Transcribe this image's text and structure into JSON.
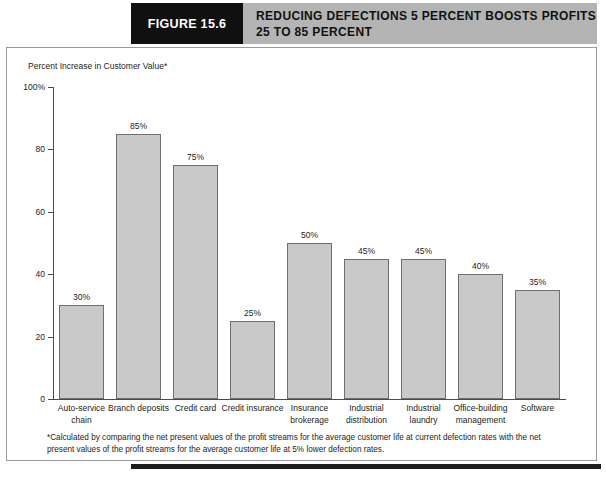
{
  "figure": {
    "number_label": "FIGURE 15.6",
    "title_line1": "REDUCING DEFECTIONS 5 PERCENT BOOSTS PROFITS",
    "title_line2": "25 TO 85 PERCENT"
  },
  "chart_data": {
    "type": "bar",
    "title": "REDUCING DEFECTIONS 5 PERCENT BOOSTS PROFITS 25 TO 85 PERCENT",
    "ylabel": "Percent Increase in Customer Value*",
    "xlabel": "",
    "ylim": [
      0,
      100
    ],
    "yticks": [
      0,
      20,
      40,
      60,
      80,
      100
    ],
    "ytick_labels": [
      "0",
      "20",
      "40",
      "60",
      "80",
      "100%"
    ],
    "grid": false,
    "legend": "none",
    "bar_color": "#c9c9c9",
    "bar_border_color": "#6f6f6f",
    "categories": [
      "Auto-service chain",
      "Branch deposits",
      "Credit card",
      "Credit insurance",
      "Insurance brokerage",
      "Industrial distribution",
      "Industrial laundry",
      "Office-building management",
      "Software"
    ],
    "values": [
      30,
      85,
      75,
      25,
      50,
      45,
      45,
      40,
      35
    ],
    "data_labels": [
      "30%",
      "85%",
      "75%",
      "25%",
      "50%",
      "45%",
      "45%",
      "40%",
      "35%"
    ]
  },
  "footnote": {
    "text": "*Calculated by comparing the net present values of the profit streams for the average customer life at current defection rates with the net present values of the profit streams for the average customer life at 5% lower defection rates."
  }
}
